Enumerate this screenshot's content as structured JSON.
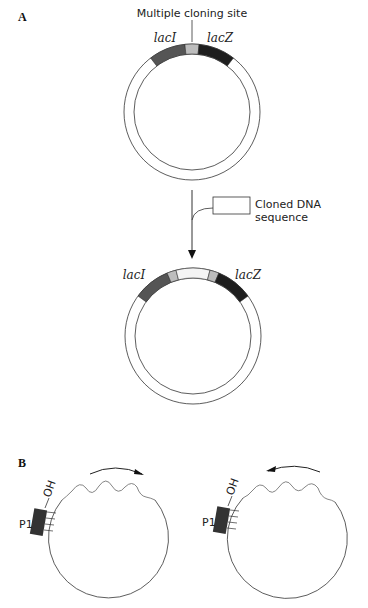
{
  "panel_a": {
    "label": "A",
    "mcs_label": "Multiple cloning site",
    "vector": {
      "gene_left": "lacI",
      "gene_right": "lacZ"
    },
    "insert_label_line1": "Cloned DNA",
    "insert_label_line2": "sequence",
    "recombinant": {
      "gene_left": "lacI",
      "gene_right": "lacZ"
    }
  },
  "panel_b": {
    "label": "B",
    "left": {
      "primer": "P1",
      "end": "OH",
      "direction": "clockwise"
    },
    "right": {
      "primer": "P1",
      "end": "OH",
      "direction": "counterclockwise"
    }
  },
  "colors": {
    "laci": "#555555",
    "lacz": "#1e1e1e",
    "mcs": "#bdbdbd",
    "primer": "#333333",
    "line": "#333333"
  }
}
